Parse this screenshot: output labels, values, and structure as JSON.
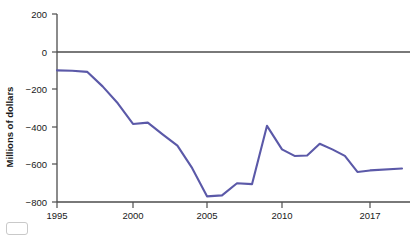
{
  "chart_data": {
    "type": "line",
    "title": "",
    "xlabel": "",
    "ylabel": "Millions of dollars",
    "xlim": [
      1995,
      2018.6
    ],
    "ylim": [
      -800,
      200
    ],
    "grid": false,
    "legend": null,
    "x_ticks": [
      1995,
      2000,
      2005,
      2010,
      2017
    ],
    "x_tick_labels": [
      "1995",
      "2000",
      "2005",
      "2010",
      "2017"
    ],
    "y_ticks": [
      200,
      0,
      -200,
      -400,
      -600,
      -800
    ],
    "y_tick_labels": [
      "200",
      "0",
      "−200",
      "−400",
      "−600",
      "−800"
    ],
    "series": [
      {
        "name": "Balance",
        "color": "#5b59a8",
        "x": [
          1995,
          1996,
          1997,
          1998,
          1999,
          2000,
          2001,
          2002,
          2003,
          2004,
          2005,
          2006,
          2007,
          2008,
          2009,
          2010,
          2011,
          2012,
          2013,
          2014,
          2015,
          2016,
          2017,
          2018
        ],
        "values": [
          -100,
          -102,
          -108,
          -185,
          -275,
          -385,
          -378,
          -440,
          -500,
          -620,
          -770,
          -765,
          -700,
          -705,
          -395,
          -520,
          -555,
          -553,
          -490,
          -520,
          -555,
          -640,
          -632,
          -622
        ]
      }
    ],
    "annotations": []
  },
  "axes": {
    "zero_reference_label": "0",
    "value_units": "Millions of dollars"
  }
}
